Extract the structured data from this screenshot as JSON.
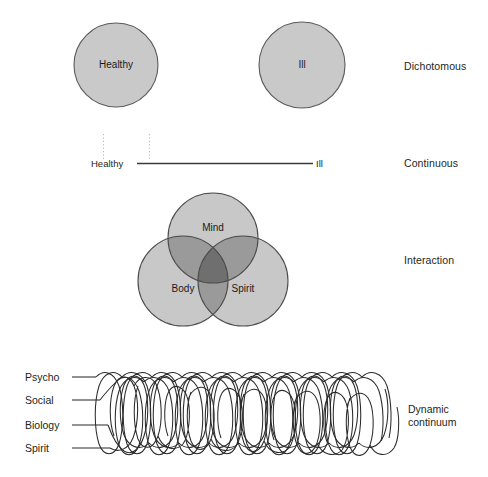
{
  "figure": {
    "rows": [
      {
        "id": "dichotomous",
        "label": "Dichotomous",
        "circles": [
          {
            "name": "healthy-circle",
            "label": "Healthy"
          },
          {
            "name": "ill-circle",
            "label": "Ill"
          }
        ]
      },
      {
        "id": "continuous",
        "label": "Continuous",
        "axis": {
          "left_label": "Healthy",
          "right_label": "Ill"
        }
      },
      {
        "id": "interaction",
        "label": "Interaction",
        "venn": [
          {
            "name": "mind-circle",
            "label": "Mind"
          },
          {
            "name": "body-circle",
            "label": "Body"
          },
          {
            "name": "spirit-circle",
            "label": "Spirit"
          }
        ]
      },
      {
        "id": "dynamic-continuum",
        "label_line1": "Dynamic",
        "label_line2": "continuum",
        "strands": [
          {
            "name": "psycho-strand",
            "label": "Psycho"
          },
          {
            "name": "social-strand",
            "label": "Social"
          },
          {
            "name": "biology-strand",
            "label": "Biology"
          },
          {
            "name": "spirit-strand",
            "label": "Spirit"
          }
        ]
      }
    ]
  },
  "colors": {
    "background": "#ffffff",
    "circle_fill": "#c9c9c9",
    "circle_stroke": "#5a5a5a",
    "venn_fill": "#c8c8c8",
    "venn_overlap_pair": "#9a9a9a",
    "venn_overlap_triple": "#6f6f6f",
    "venn_stroke": "#4d4d4d",
    "line": "#3a3a3a",
    "dotted_guide": "#b8b8b8",
    "text": "#231f20"
  }
}
